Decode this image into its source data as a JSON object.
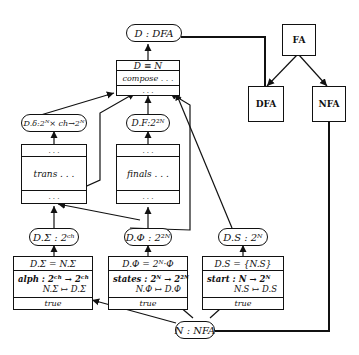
{
  "diagram": {
    "nodes": {
      "d_dfa": {
        "label": "D : DFA"
      },
      "compose": {
        "header": "D ≡ N",
        "body": "compose . . .",
        "footer": ". . ."
      },
      "d_delta": {
        "label": "D.δ:2ᴺ× ch→2ᴺ"
      },
      "d_f": {
        "label": "D.F:2²ᴺ"
      },
      "trans": {
        "header": ". . .",
        "body": "trans . . .",
        "footer": ". . ."
      },
      "finals": {
        "header": ". . .",
        "body": "finals . . .",
        "footer": ". . ."
      },
      "d_sigma": {
        "label": "D.Σ : 2ᶜʰ"
      },
      "d_phi": {
        "label": "D.Φ : 2²ᴺ"
      },
      "d_s": {
        "label": "D.S : 2ᴺ"
      },
      "alph": {
        "header": "D.Σ = N.Σ",
        "line1": "alph : 2ᶜʰ → 2ᶜʰ",
        "line2": "N.Σ ↦ D.Σ",
        "footer": "true"
      },
      "states": {
        "header": "D.Φ = 2ᴺ·Φ",
        "line1": "states : 2ᴺ → 2²ᴺ",
        "line2": "N.Φ ↦ D.Φ",
        "footer": "true"
      },
      "start": {
        "header": "D.S = {N.S}",
        "line1": "start : N → 2ᴺ",
        "line2": "N.S ↦ D.S",
        "footer": "true"
      },
      "n_nfa": {
        "label": "N : NFA"
      },
      "fa": {
        "label": "FA"
      },
      "dfa": {
        "label": "DFA"
      },
      "nfa": {
        "label": "NFA"
      }
    },
    "line_color": "#111111",
    "background": "#ffffff"
  }
}
